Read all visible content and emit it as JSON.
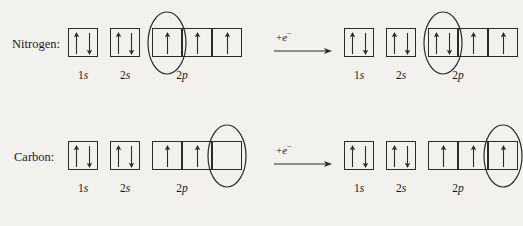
{
  "diagram": {
    "background_color": "#f2f1ee",
    "line_color": "#2b2b2b",
    "subshell_labels": [
      "1s",
      "2s",
      "2p"
    ],
    "reaction_label": "+e",
    "reaction_superscript": "−",
    "rows": [
      {
        "id": "nitrogen",
        "element_label": "Nitrogen:",
        "before": {
          "name": "nitrogen-before-config",
          "groups": [
            {
              "subshell": "1s",
              "n": "1",
              "orbital": "s",
              "boxes": [
                {
                  "electrons": [
                    "up",
                    "down"
                  ]
                }
              ]
            },
            {
              "subshell": "2s",
              "n": "2",
              "orbital": "s",
              "boxes": [
                {
                  "electrons": [
                    "up",
                    "down"
                  ]
                }
              ]
            },
            {
              "subshell": "2p",
              "n": "2",
              "orbital": "p",
              "boxes": [
                {
                  "electrons": [
                    "up"
                  ],
                  "highlighted": true
                },
                {
                  "electrons": [
                    "up"
                  ]
                },
                {
                  "electrons": [
                    "up"
                  ]
                }
              ]
            }
          ]
        },
        "after": {
          "name": "nitrogen-after-config",
          "groups": [
            {
              "subshell": "1s",
              "n": "1",
              "orbital": "s",
              "boxes": [
                {
                  "electrons": [
                    "up",
                    "down"
                  ]
                }
              ]
            },
            {
              "subshell": "2s",
              "n": "2",
              "orbital": "s",
              "boxes": [
                {
                  "electrons": [
                    "up",
                    "down"
                  ]
                }
              ]
            },
            {
              "subshell": "2p",
              "n": "2",
              "orbital": "p",
              "boxes": [
                {
                  "electrons": [
                    "up",
                    "down"
                  ],
                  "highlighted": true
                },
                {
                  "electrons": [
                    "up"
                  ]
                },
                {
                  "electrons": [
                    "up"
                  ]
                }
              ]
            }
          ]
        }
      },
      {
        "id": "carbon",
        "element_label": "Carbon:",
        "before": {
          "name": "carbon-before-config",
          "groups": [
            {
              "subshell": "1s",
              "n": "1",
              "orbital": "s",
              "boxes": [
                {
                  "electrons": [
                    "up",
                    "down"
                  ]
                }
              ]
            },
            {
              "subshell": "2s",
              "n": "2",
              "orbital": "s",
              "boxes": [
                {
                  "electrons": [
                    "up",
                    "down"
                  ]
                }
              ]
            },
            {
              "subshell": "2p",
              "n": "2",
              "orbital": "p",
              "boxes": [
                {
                  "electrons": [
                    "up"
                  ]
                },
                {
                  "electrons": [
                    "up"
                  ]
                },
                {
                  "electrons": [],
                  "highlighted": true
                }
              ]
            }
          ]
        },
        "after": {
          "name": "carbon-after-config",
          "groups": [
            {
              "subshell": "1s",
              "n": "1",
              "orbital": "s",
              "boxes": [
                {
                  "electrons": [
                    "up",
                    "down"
                  ]
                }
              ]
            },
            {
              "subshell": "2s",
              "n": "2",
              "orbital": "s",
              "boxes": [
                {
                  "electrons": [
                    "up",
                    "down"
                  ]
                }
              ]
            },
            {
              "subshell": "2p",
              "n": "2",
              "orbital": "p",
              "boxes": [
                {
                  "electrons": [
                    "up"
                  ]
                },
                {
                  "electrons": [
                    "up"
                  ]
                },
                {
                  "electrons": [
                    "up"
                  ],
                  "highlighted": true
                }
              ]
            }
          ]
        }
      }
    ]
  }
}
